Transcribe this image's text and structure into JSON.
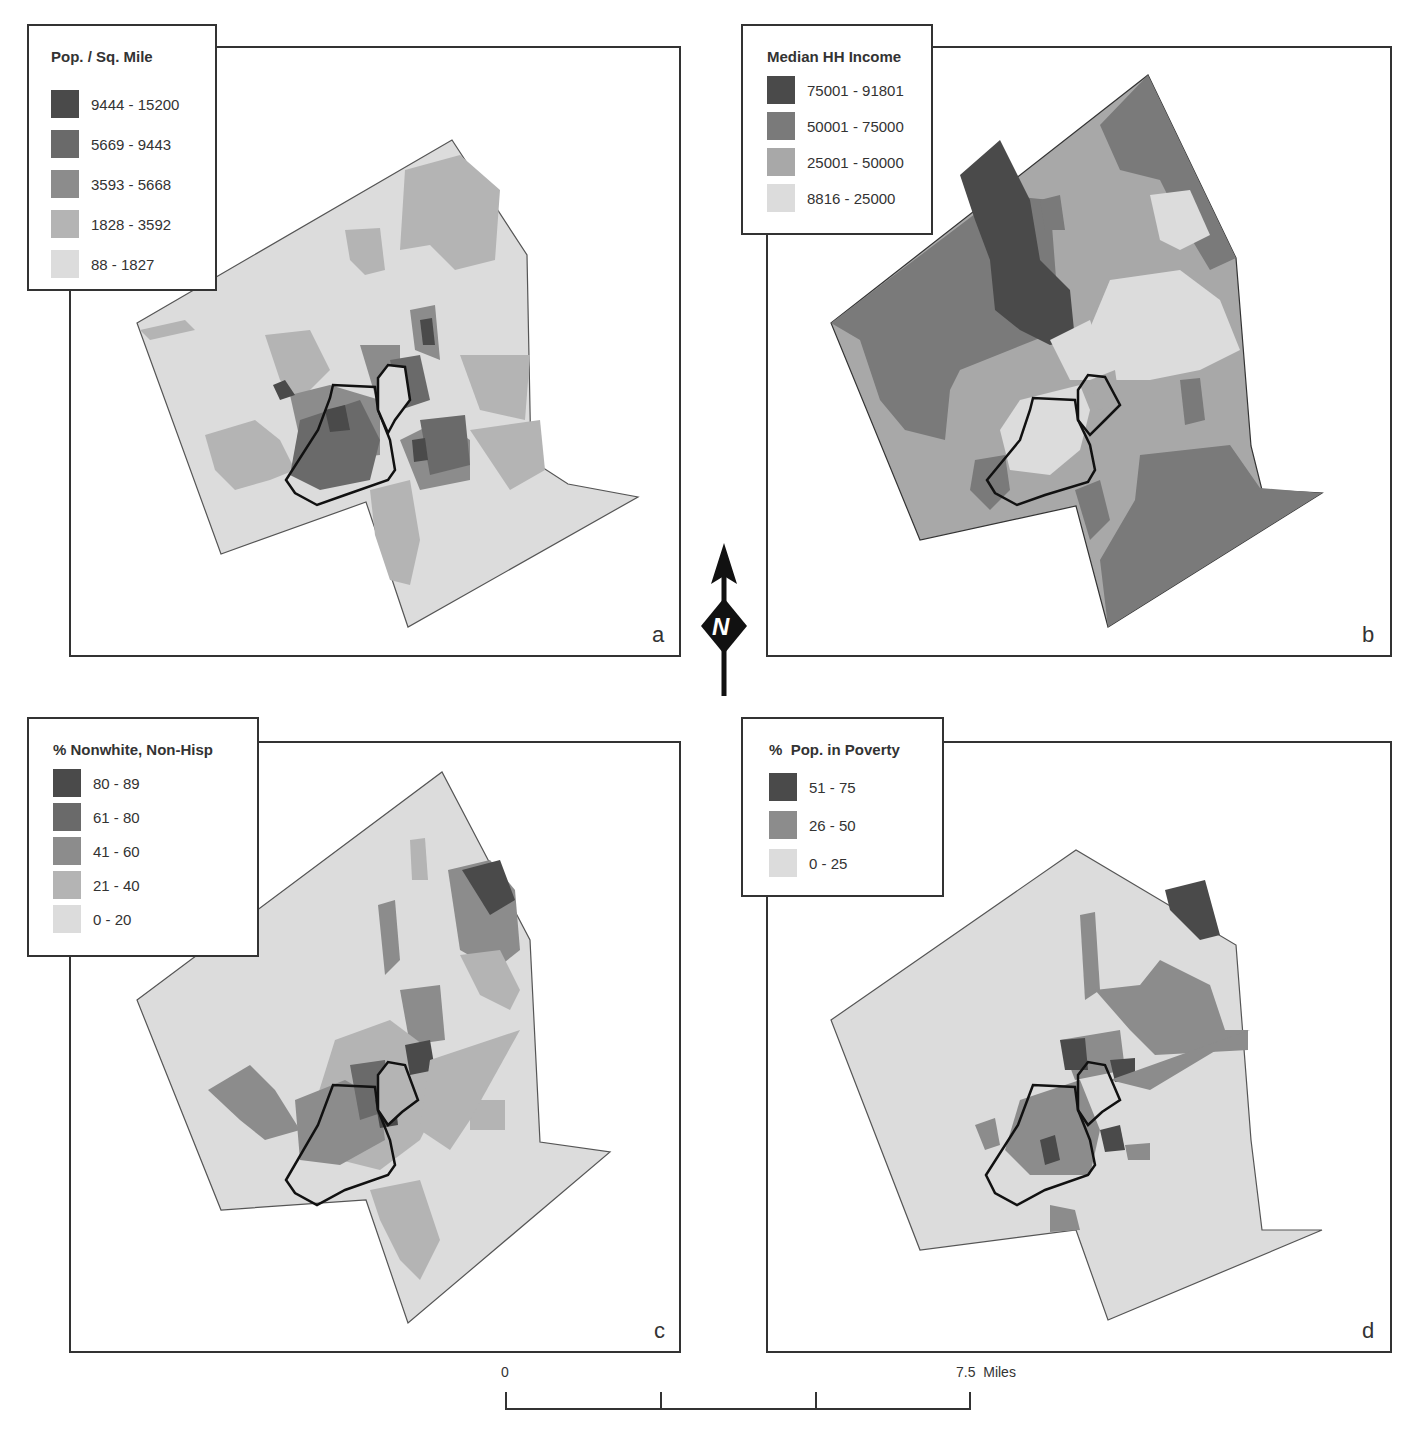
{
  "figure": {
    "panels": [
      {
        "id": "a",
        "letter": "a",
        "legend": {
          "title": "Pop. / Sq. Mile",
          "classes": [
            {
              "label": "9444 - 15200",
              "color": "#4a4a4a"
            },
            {
              "label": "5669 - 9443",
              "color": "#6a6a6a"
            },
            {
              "label": "3593 - 5668",
              "color": "#8c8c8c"
            },
            {
              "label": "1828 - 3592",
              "color": "#b4b4b4"
            },
            {
              "label": "88 - 1827",
              "color": "#dcdcdc"
            }
          ]
        }
      },
      {
        "id": "b",
        "letter": "b",
        "legend": {
          "title": "Median HH Income",
          "classes": [
            {
              "label": "75001 - 91801",
              "color": "#4a4a4a"
            },
            {
              "label": "50001 - 75000",
              "color": "#7a7a7a"
            },
            {
              "label": "25001 - 50000",
              "color": "#a8a8a8"
            },
            {
              "label": "8816 - 25000",
              "color": "#dcdcdc"
            }
          ]
        }
      },
      {
        "id": "c",
        "letter": "c",
        "legend": {
          "title": "% Nonwhite, Non-Hisp",
          "classes": [
            {
              "label": "80 - 89",
              "color": "#4a4a4a"
            },
            {
              "label": "61 - 80",
              "color": "#6a6a6a"
            },
            {
              "label": "41 - 60",
              "color": "#8c8c8c"
            },
            {
              "label": "21 - 40",
              "color": "#b4b4b4"
            },
            {
              "label": "0 - 20",
              "color": "#dcdcdc"
            }
          ]
        }
      },
      {
        "id": "d",
        "letter": "d",
        "legend": {
          "title": "%  Pop. in Poverty",
          "classes": [
            {
              "label": "51 - 75",
              "color": "#4a4a4a"
            },
            {
              "label": "26 - 50",
              "color": "#8c8c8c"
            },
            {
              "label": "0 - 25",
              "color": "#dcdcdc"
            }
          ]
        }
      }
    ],
    "north_arrow": {
      "label": "N"
    },
    "scale_bar": {
      "start_label": "0",
      "end_label": "7.5  Miles"
    }
  }
}
